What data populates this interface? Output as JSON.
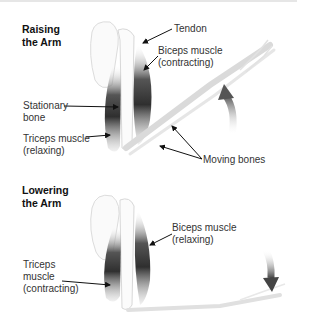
{
  "panels": [
    {
      "title_line1": "Raising",
      "title_line2": "the Arm",
      "labels": {
        "tendon": "Tendon",
        "biceps_line1": "Biceps muscle",
        "biceps_line2": "(contracting)",
        "stationary_line1": "Stationary",
        "stationary_line2": "bone",
        "triceps_line1": "Triceps muscle",
        "triceps_line2": "(relaxing)",
        "moving_bones": "Moving bones"
      },
      "motion_arrow": "up-arrow"
    },
    {
      "title_line1": "Lowering",
      "title_line2": "the Arm",
      "labels": {
        "biceps_line1": "Biceps muscle",
        "biceps_line2": "(relaxing)",
        "triceps_line1": "Triceps",
        "triceps_line2": "muscle",
        "triceps_line3": "(contracting)"
      },
      "motion_arrow": "down-arrow"
    }
  ],
  "colors": {
    "muscle_dark": "#3a3a3a",
    "bone_outline": "#d8d8d8",
    "text": "#333333"
  }
}
